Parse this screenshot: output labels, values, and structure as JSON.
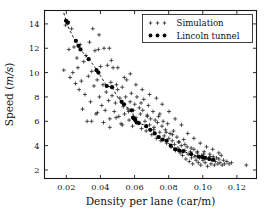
{
  "figure": {
    "background": "#ffffff",
    "foreground": "#111111"
  },
  "chart_data": {
    "type": "scatter",
    "title": "",
    "xlabel_plain": "Density per lane (car/m)",
    "xlabel_parts": {
      "main": "Density per lane (car/m)"
    },
    "ylabel_parts": {
      "prefix": "Speed (",
      "italic": "m/s",
      "suffix": ")"
    },
    "ylabel_plain": "Speed (m/s)",
    "xlim": [
      0.0072,
      0.1315
    ],
    "ylim": [
      1.3,
      15.1
    ],
    "xticks": [
      0.02,
      0.04,
      0.06,
      0.08,
      0.1,
      0.12
    ],
    "xticklabels": [
      "0.02",
      "0.04",
      "0.06",
      "0.08",
      "0.10",
      "0.12"
    ],
    "yticks": [
      2,
      4,
      6,
      8,
      10,
      12,
      14
    ],
    "yticklabels": [
      "2",
      "4",
      "6",
      "8",
      "10",
      "12",
      "14"
    ],
    "grid": false,
    "legend_position": "top-right",
    "legend": [
      {
        "label": "Simulation",
        "marker": "plus",
        "color": "#1b1b1b"
      },
      {
        "label": "Lincoln tunnel",
        "marker": "filled-circle",
        "color": "#000000"
      }
    ],
    "series": [
      {
        "name": "Simulation",
        "marker": "plus",
        "color": "#1b1b1b",
        "points": [
          [
            0.0185,
            10.2
          ],
          [
            0.0196,
            13.9
          ],
          [
            0.0208,
            14.2
          ],
          [
            0.0215,
            11.9
          ],
          [
            0.0222,
            9.6
          ],
          [
            0.0231,
            13.6
          ],
          [
            0.0238,
            10.0
          ],
          [
            0.0245,
            12.1
          ],
          [
            0.0254,
            9.1
          ],
          [
            0.0262,
            11.2
          ],
          [
            0.0268,
            10.4
          ],
          [
            0.0275,
            8.6
          ],
          [
            0.0281,
            12.3
          ],
          [
            0.0288,
            9.3
          ],
          [
            0.0295,
            7.0
          ],
          [
            0.0302,
            10.9
          ],
          [
            0.0309,
            8.2
          ],
          [
            0.0315,
            11.4
          ],
          [
            0.0322,
            6.0
          ],
          [
            0.0329,
            9.7
          ],
          [
            0.0336,
            12.5
          ],
          [
            0.0342,
            7.6
          ],
          [
            0.0349,
            10.1
          ],
          [
            0.0355,
            13.6
          ],
          [
            0.0362,
            8.9
          ],
          [
            0.0368,
            11.8
          ],
          [
            0.0374,
            6.6
          ],
          [
            0.0381,
            9.4
          ],
          [
            0.0388,
            11.9
          ],
          [
            0.0394,
            8.0
          ],
          [
            0.0401,
            10.5
          ],
          [
            0.0408,
            7.3
          ],
          [
            0.0415,
            9.0
          ],
          [
            0.0421,
            12.0
          ],
          [
            0.0428,
            6.9
          ],
          [
            0.0434,
            8.4
          ],
          [
            0.0441,
            10.6
          ],
          [
            0.0448,
            7.7
          ],
          [
            0.0455,
            6.2
          ],
          [
            0.0461,
            9.2
          ],
          [
            0.0468,
            8.1
          ],
          [
            0.0474,
            10.4
          ],
          [
            0.0481,
            6.8
          ],
          [
            0.0488,
            7.5
          ],
          [
            0.0494,
            9.0
          ],
          [
            0.0501,
            8.6
          ],
          [
            0.0508,
            6.4
          ],
          [
            0.0514,
            7.9
          ],
          [
            0.0521,
            5.8
          ],
          [
            0.0528,
            8.8
          ],
          [
            0.0534,
            7.2
          ],
          [
            0.0541,
            6.6
          ],
          [
            0.0548,
            8.0
          ],
          [
            0.0554,
            9.4
          ],
          [
            0.0561,
            7.0
          ],
          [
            0.0568,
            6.1
          ],
          [
            0.0574,
            7.6
          ],
          [
            0.0581,
            8.3
          ],
          [
            0.0588,
            5.6
          ],
          [
            0.0594,
            6.9
          ],
          [
            0.0601,
            7.4
          ],
          [
            0.0608,
            6.3
          ],
          [
            0.0614,
            8.0
          ],
          [
            0.0621,
            5.9
          ],
          [
            0.0628,
            7.1
          ],
          [
            0.0634,
            6.6
          ],
          [
            0.0641,
            5.4
          ],
          [
            0.0648,
            6.9
          ],
          [
            0.0654,
            7.8
          ],
          [
            0.0661,
            6.0
          ],
          [
            0.0668,
            5.2
          ],
          [
            0.0674,
            6.5
          ],
          [
            0.0681,
            7.3
          ],
          [
            0.0688,
            5.7
          ],
          [
            0.0694,
            6.2
          ],
          [
            0.0701,
            4.9
          ],
          [
            0.0708,
            6.8
          ],
          [
            0.0714,
            5.5
          ],
          [
            0.0721,
            6.1
          ],
          [
            0.0728,
            4.6
          ],
          [
            0.0734,
            5.9
          ],
          [
            0.0741,
            6.4
          ],
          [
            0.0748,
            5.1
          ],
          [
            0.0754,
            4.4
          ],
          [
            0.0761,
            5.6
          ],
          [
            0.0768,
            6.0
          ],
          [
            0.0774,
            4.8
          ],
          [
            0.0781,
            5.3
          ],
          [
            0.0788,
            4.2
          ],
          [
            0.0794,
            5.8
          ],
          [
            0.0801,
            4.6
          ],
          [
            0.0808,
            5.0
          ],
          [
            0.0814,
            3.9
          ],
          [
            0.0821,
            4.4
          ],
          [
            0.0828,
            5.2
          ],
          [
            0.0834,
            4.1
          ],
          [
            0.0841,
            3.6
          ],
          [
            0.0848,
            4.7
          ],
          [
            0.0854,
            3.8
          ],
          [
            0.0861,
            4.3
          ],
          [
            0.0868,
            3.4
          ],
          [
            0.0874,
            4.0
          ],
          [
            0.0881,
            3.2
          ],
          [
            0.0888,
            4.5
          ],
          [
            0.0894,
            3.6
          ],
          [
            0.0901,
            2.9
          ],
          [
            0.0908,
            3.9
          ],
          [
            0.0914,
            3.3
          ],
          [
            0.0921,
            2.7
          ],
          [
            0.0928,
            3.5
          ],
          [
            0.0934,
            3.0
          ],
          [
            0.0941,
            2.5
          ],
          [
            0.0948,
            3.7
          ],
          [
            0.0954,
            3.1
          ],
          [
            0.0961,
            2.8
          ],
          [
            0.0968,
            3.4
          ],
          [
            0.0974,
            2.6
          ],
          [
            0.0981,
            3.0
          ],
          [
            0.0988,
            2.4
          ],
          [
            0.0994,
            3.2
          ],
          [
            0.1001,
            2.8
          ],
          [
            0.1008,
            3.5
          ],
          [
            0.1014,
            2.6
          ],
          [
            0.1021,
            3.0
          ],
          [
            0.1028,
            2.3
          ],
          [
            0.1034,
            2.9
          ],
          [
            0.1041,
            3.3
          ],
          [
            0.1048,
            2.5
          ],
          [
            0.1054,
            2.8
          ],
          [
            0.1061,
            3.1
          ],
          [
            0.1068,
            2.4
          ],
          [
            0.1074,
            2.7
          ],
          [
            0.1081,
            3.0
          ],
          [
            0.1088,
            2.5
          ],
          [
            0.1094,
            2.9
          ],
          [
            0.1101,
            2.6
          ],
          [
            0.1108,
            3.2
          ],
          [
            0.1114,
            2.4
          ],
          [
            0.1121,
            2.8
          ],
          [
            0.1128,
            2.5
          ],
          [
            0.1141,
            2.7
          ],
          [
            0.1154,
            2.5
          ],
          [
            0.1168,
            2.6
          ],
          [
            0.1255,
            2.4
          ],
          [
            0.0464,
            11.0
          ],
          [
            0.0502,
            10.4
          ],
          [
            0.0452,
            12.0
          ],
          [
            0.0392,
            13.1
          ],
          [
            0.054,
            9.6
          ],
          [
            0.0575,
            9.9
          ],
          [
            0.0608,
            9.0
          ],
          [
            0.0645,
            8.6
          ],
          [
            0.0688,
            8.2
          ],
          [
            0.0728,
            7.9
          ],
          [
            0.0762,
            7.4
          ],
          [
            0.0802,
            6.8
          ],
          [
            0.0838,
            6.2
          ],
          [
            0.0875,
            5.7
          ],
          [
            0.0912,
            5.0
          ],
          [
            0.0948,
            4.6
          ],
          [
            0.0985,
            4.2
          ],
          [
            0.1022,
            3.9
          ],
          [
            0.1058,
            3.7
          ],
          [
            0.1094,
            3.4
          ],
          [
            0.0348,
            6.0
          ],
          [
            0.0382,
            6.7
          ],
          [
            0.0418,
            5.9
          ],
          [
            0.0455,
            5.5
          ],
          [
            0.0492,
            6.3
          ],
          [
            0.0528,
            5.7
          ],
          [
            0.0565,
            6.8
          ],
          [
            0.0602,
            6.2
          ],
          [
            0.0638,
            7.5
          ],
          [
            0.0675,
            6.4
          ],
          [
            0.0712,
            5.3
          ],
          [
            0.0748,
            6.6
          ],
          [
            0.0785,
            5.1
          ],
          [
            0.0822,
            4.9
          ],
          [
            0.0858,
            4.3
          ],
          [
            0.0895,
            4.1
          ],
          [
            0.0932,
            3.8
          ],
          [
            0.0968,
            3.5
          ],
          [
            0.1005,
            3.3
          ],
          [
            0.1042,
            3.1
          ]
        ]
      },
      {
        "name": "Lincoln tunnel",
        "marker": "filled-circle",
        "color": "#000000",
        "connected_with": "dashed-line",
        "points": [
          [
            0.0198,
            14.25
          ],
          [
            0.0209,
            14.1
          ],
          [
            0.0256,
            12.6
          ],
          [
            0.0271,
            12.2
          ],
          [
            0.0283,
            11.9
          ],
          [
            0.0331,
            11.1
          ],
          [
            0.0377,
            10.2
          ],
          [
            0.0388,
            10.0
          ],
          [
            0.0437,
            8.9
          ],
          [
            0.0468,
            8.8
          ],
          [
            0.0524,
            7.6
          ],
          [
            0.0538,
            7.4
          ],
          [
            0.0582,
            6.9
          ],
          [
            0.0591,
            6.3
          ],
          [
            0.0598,
            6.2
          ],
          [
            0.0604,
            6.1
          ],
          [
            0.0612,
            5.9
          ],
          [
            0.0625,
            5.85
          ],
          [
            0.0668,
            5.6
          ],
          [
            0.0692,
            5.3
          ],
          [
            0.0718,
            5.0
          ],
          [
            0.0742,
            4.7
          ],
          [
            0.0765,
            4.5
          ],
          [
            0.0788,
            4.4
          ],
          [
            0.0812,
            4.0
          ],
          [
            0.0838,
            3.7
          ],
          [
            0.0862,
            3.6
          ],
          [
            0.0885,
            3.55
          ],
          [
            0.0932,
            3.3
          ],
          [
            0.0975,
            3.1
          ],
          [
            0.0998,
            3.05
          ],
          [
            0.1012,
            3.0
          ],
          [
            0.1038,
            2.9
          ],
          [
            0.1061,
            2.85
          ]
        ]
      }
    ],
    "trend_line": {
      "style": "dashed",
      "color": "#000000",
      "points": [
        [
          0.0185,
          14.9
        ],
        [
          0.0198,
          14.3
        ],
        [
          0.0215,
          13.6
        ],
        [
          0.0245,
          12.8
        ],
        [
          0.0271,
          12.2
        ],
        [
          0.03,
          11.6
        ],
        [
          0.0331,
          11.1
        ],
        [
          0.036,
          10.6
        ],
        [
          0.0388,
          10.0
        ],
        [
          0.0415,
          9.4
        ],
        [
          0.0437,
          8.9
        ],
        [
          0.0468,
          8.8
        ],
        [
          0.05,
          8.0
        ],
        [
          0.0524,
          7.6
        ],
        [
          0.055,
          7.2
        ],
        [
          0.0582,
          6.9
        ],
        [
          0.0605,
          6.1
        ],
        [
          0.0625,
          5.85
        ],
        [
          0.0655,
          5.7
        ],
        [
          0.0692,
          5.3
        ],
        [
          0.0718,
          5.0
        ],
        [
          0.0742,
          4.7
        ],
        [
          0.0765,
          4.5
        ],
        [
          0.0788,
          4.4
        ],
        [
          0.0812,
          4.0
        ],
        [
          0.0838,
          3.7
        ],
        [
          0.0862,
          3.6
        ],
        [
          0.0885,
          3.55
        ],
        [
          0.091,
          3.4
        ],
        [
          0.0932,
          3.3
        ],
        [
          0.0955,
          3.2
        ],
        [
          0.0975,
          3.1
        ],
        [
          0.0998,
          3.05
        ],
        [
          0.102,
          2.95
        ],
        [
          0.1038,
          2.9
        ],
        [
          0.1061,
          2.85
        ]
      ]
    }
  }
}
